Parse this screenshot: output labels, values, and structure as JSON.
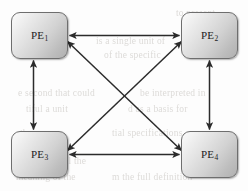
{
  "figure": {
    "background_color": "#fdfdfd",
    "width": 248,
    "height": 191
  },
  "nodes": [
    {
      "id": "pe1",
      "label": "PE",
      "subscript": "1",
      "full_label": "PE1",
      "x": 11,
      "y": 12,
      "width": 57,
      "height": 47
    },
    {
      "id": "pe2",
      "label": "PE",
      "subscript": "2",
      "full_label": "PE2",
      "x": 181,
      "y": 12,
      "width": 57,
      "height": 47
    },
    {
      "id": "pe3",
      "label": "PE",
      "subscript": "3",
      "full_label": "PE3",
      "x": 11,
      "y": 131,
      "width": 57,
      "height": 47
    },
    {
      "id": "pe4",
      "label": "PE",
      "subscript": "4",
      "full_label": "PE4",
      "x": 181,
      "y": 131,
      "width": 57,
      "height": 47
    }
  ],
  "edges": [
    {
      "id": "edge-pe1-pe2",
      "from": "pe1",
      "to": "pe2",
      "direction": "bidirectional",
      "orientation": "horizontal-top"
    },
    {
      "id": "edge-pe3-pe4",
      "from": "pe3",
      "to": "pe4",
      "direction": "bidirectional",
      "orientation": "horizontal-bottom"
    },
    {
      "id": "edge-pe1-pe3",
      "from": "pe1",
      "to": "pe3",
      "direction": "bidirectional",
      "orientation": "vertical-left"
    },
    {
      "id": "edge-pe2-pe4",
      "from": "pe2",
      "to": "pe4",
      "direction": "bidirectional",
      "orientation": "vertical-right"
    },
    {
      "id": "edge-pe1-pe4",
      "from": "pe1",
      "to": "pe4",
      "direction": "bidirectional",
      "orientation": "diagonal-descending"
    },
    {
      "id": "edge-pe2-pe3",
      "from": "pe2",
      "to": "pe3",
      "direction": "bidirectional",
      "orientation": "diagonal-ascending"
    }
  ],
  "style": {
    "edge_color": "#2b2b2b",
    "node_border_color": "#6e6e6e",
    "node_fill_top": "#fbfbfb",
    "node_fill_bottom": "#b0b0b0",
    "label_color": "#1c1c1c",
    "bleed_text_color": "#c9c6c2"
  },
  "bleed_text": [
    {
      "id": "bleed-1",
      "text": "is a single unit of",
      "x": 96,
      "y": 36
    },
    {
      "id": "bleed-2",
      "text": "of the specific",
      "x": 104,
      "y": 50
    },
    {
      "id": "bleed-3",
      "text": "ncludes a",
      "x": 12,
      "y": 49
    },
    {
      "id": "bleed-4",
      "text": "e second  that could",
      "x": 18,
      "y": 88
    },
    {
      "id": "bleed-5",
      "text": "be interpreted in",
      "x": 140,
      "y": 88
    },
    {
      "id": "bleed-6",
      "text": "tiful  a  unit",
      "x": 26,
      "y": 104
    },
    {
      "id": "bleed-7",
      "text": "d  as  a  basis  for",
      "x": 128,
      "y": 104
    },
    {
      "id": "bleed-8",
      "text": "the ex",
      "x": 20,
      "y": 128
    },
    {
      "id": "bleed-9",
      "text": "tial  specifications",
      "x": 112,
      "y": 128
    },
    {
      "id": "bleed-10",
      "text": "s  of  all  the",
      "x": 44,
      "y": 156
    },
    {
      "id": "bleed-11",
      "text": "meaning  of  the",
      "x": 16,
      "y": 172
    },
    {
      "id": "bleed-12",
      "text": "m  the  full  definition",
      "x": 112,
      "y": 172
    },
    {
      "id": "bleed-13",
      "text": "to  present",
      "x": 176,
      "y": 8
    }
  ]
}
